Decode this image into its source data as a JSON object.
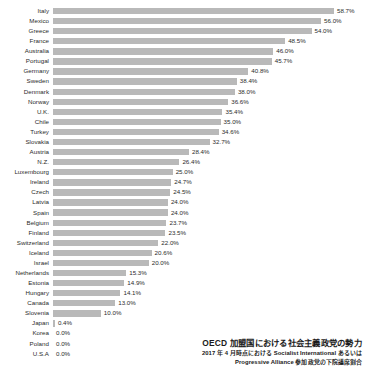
{
  "chart_data": {
    "type": "bar",
    "orientation": "horizontal",
    "title": "OECD 加盟国における社会主義政党の勢力",
    "subtitle_line1": "2017 年 4 月時点における Socialist International あるいは",
    "subtitle_line2": "Progressive Alliance 参加政党の下院議席割合",
    "xlabel": "",
    "ylabel": "",
    "xlim": [
      0,
      58.7
    ],
    "grid": false,
    "legend": false,
    "bar_color": "#b9b9b9",
    "value_suffix": "%",
    "categories": [
      "Italy",
      "Mexico",
      "Greece",
      "France",
      "Australia",
      "Portugal",
      "Germany",
      "Sweden",
      "Denmark",
      "Norway",
      "U.K.",
      "Chile",
      "Turkey",
      "Slovakia",
      "Austria",
      "N.Z.",
      "Luxembourg",
      "Ireland",
      "Czech",
      "Latvia",
      "Spain",
      "Belgium",
      "Finland",
      "Switzerland",
      "Iceland",
      "Israel",
      "Netherlands",
      "Estonia",
      "Hungary",
      "Canada",
      "Slovenia",
      "Japan",
      "Korea",
      "Poland",
      "U.S.A"
    ],
    "values": [
      58.7,
      56.0,
      54.0,
      48.5,
      46.0,
      45.7,
      40.8,
      38.4,
      38.0,
      36.6,
      35.4,
      35.0,
      34.6,
      32.7,
      28.4,
      26.4,
      25.0,
      24.7,
      24.5,
      24.0,
      24.0,
      23.7,
      23.5,
      22.0,
      20.6,
      20.0,
      15.3,
      14.9,
      14.1,
      13.0,
      10.0,
      0.4,
      0.0,
      0.0,
      0.0
    ],
    "value_labels": [
      "58.7%",
      "56.0%",
      "54.0%",
      "48.5%",
      "46.0%",
      "45.7%",
      "40.8%",
      "38.4%",
      "38.0%",
      "36.6%",
      "35.4%",
      "35.0%",
      "34.6%",
      "32.7%",
      "28.4%",
      "26.4%",
      "25.0%",
      "24.7%",
      "24.5%",
      "24.0%",
      "24.0%",
      "23.7%",
      "23.5%",
      "22.0%",
      "20.6%",
      "20.0%",
      "15.3%",
      "14.9%",
      "14.1%",
      "13.0%",
      "10.0%",
      "0.4%",
      "0.0%",
      "0.0%",
      "0.0%"
    ]
  }
}
